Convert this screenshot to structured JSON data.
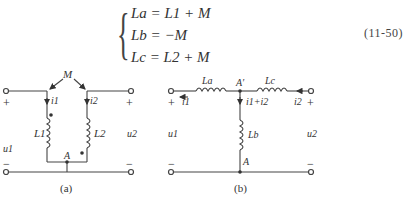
{
  "equation": {
    "lines": [
      "La = L1 + M",
      "Lb = −M",
      "Lc = L2 + M"
    ],
    "number": "(11-50)"
  },
  "figure_a": {
    "caption": "(a)",
    "mutual_label": "M",
    "inductor_left": "L1",
    "inductor_right": "L2",
    "current_left": "i1",
    "current_right": "i2",
    "voltage_left": "u1",
    "voltage_right": "u2",
    "node_label": "A",
    "plus": "+",
    "minus": "−"
  },
  "figure_b": {
    "caption": "(b)",
    "inductor_a": "La",
    "inductor_b": "Lb",
    "inductor_c": "Lc",
    "current_left": "i1",
    "current_right": "i2",
    "current_middle": "i1+i2",
    "voltage_left": "u1",
    "voltage_right": "u2",
    "node_top": "A′",
    "node_bottom": "A",
    "plus": "+",
    "minus": "−"
  }
}
